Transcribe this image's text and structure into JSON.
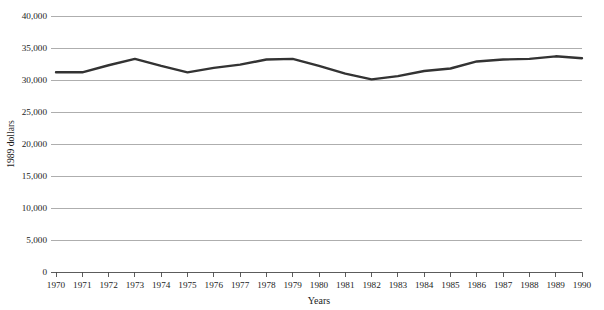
{
  "chart_data": {
    "type": "line",
    "title": "",
    "subtitle": "",
    "xlabel": "Years",
    "ylabel": "1989 dollars",
    "x": [
      1970,
      1971,
      1972,
      1973,
      1974,
      1975,
      1976,
      1977,
      1978,
      1979,
      1980,
      1981,
      1982,
      1983,
      1984,
      1985,
      1986,
      1987,
      1988,
      1989,
      1990
    ],
    "categories": [
      "1970",
      "1971",
      "1972",
      "1973",
      "1974",
      "1975",
      "1976",
      "1977",
      "1978",
      "1979",
      "1980",
      "1981",
      "1982",
      "1983",
      "1984",
      "1985",
      "1986",
      "1987",
      "1988",
      "1989",
      "1990"
    ],
    "values": [
      31200,
      31200,
      32300,
      33300,
      32200,
      31200,
      31900,
      32400,
      33200,
      33300,
      32200,
      31000,
      30100,
      30600,
      31400,
      31800,
      32900,
      33200,
      33300,
      33700,
      33400
    ],
    "series": [
      {
        "name": "Median income (1989 dollars)",
        "values": [
          31200,
          31200,
          32300,
          33300,
          32200,
          31200,
          31900,
          32400,
          33200,
          33300,
          32200,
          31000,
          30100,
          30600,
          31400,
          31800,
          32900,
          33200,
          33300,
          33700,
          33400
        ]
      }
    ],
    "xlim": [
      1970,
      1990
    ],
    "ylim": [
      0,
      40000
    ],
    "ytick_values": [
      0,
      5000,
      10000,
      15000,
      20000,
      25000,
      30000,
      35000,
      40000
    ],
    "ytick_labels": [
      "0",
      "5,000",
      "10,000",
      "15,000",
      "20,000",
      "25,000",
      "30,000",
      "35,000",
      "40,000"
    ],
    "xtick_labels": [
      "1970",
      "1971",
      "1972",
      "1973",
      "1974",
      "1975",
      "1976",
      "1977",
      "1978",
      "1979",
      "1980",
      "1981",
      "1982",
      "1983",
      "1984",
      "1985",
      "1986",
      "1987",
      "1988",
      "1989",
      "1990"
    ],
    "grid": "horizontal",
    "legend": "none",
    "line_color": "#333333",
    "grid_color": "#9a9a9a",
    "axis_color": "#4a4a4a",
    "background_color": "#ffffff"
  }
}
